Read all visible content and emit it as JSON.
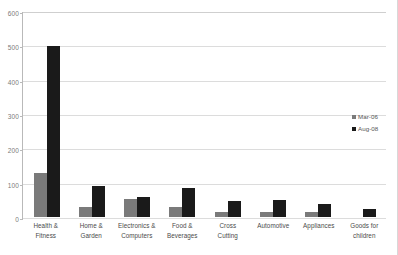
{
  "chart_data": {
    "type": "bar",
    "title": "",
    "subtitle": "",
    "xlabel": "",
    "ylabel": "",
    "ylim": [
      0,
      600
    ],
    "yticks": [
      0,
      100,
      200,
      300,
      400,
      500,
      600
    ],
    "grid": true,
    "legend_position": "right",
    "categories": [
      "Health & Fitness",
      "Home & Garden",
      "Electronics & Computers",
      "Food & Beverages",
      "Cross Cutting",
      "Automotive",
      "Appliances",
      "Goods for children"
    ],
    "category_lines": [
      [
        "Health &",
        "Fitness"
      ],
      [
        "Home &",
        "Garden"
      ],
      [
        "Electronics &",
        "Computers"
      ],
      [
        "Food &",
        "Beverages"
      ],
      [
        "Cross",
        "Cutting"
      ],
      [
        "Automotive",
        ""
      ],
      [
        "Appliances",
        ""
      ],
      [
        "Goods for",
        "children"
      ]
    ],
    "series": [
      {
        "name": "Mar-06",
        "color": "#7a7a7a",
        "values": [
          128,
          28,
          52,
          30,
          14,
          16,
          16,
          0
        ]
      },
      {
        "name": "Aug-08",
        "color": "#1a1a1a",
        "values": [
          500,
          92,
          58,
          84,
          46,
          50,
          38,
          22
        ]
      }
    ]
  },
  "legend": {
    "items": [
      {
        "label": "Mar-06",
        "color": "#7a7a7a"
      },
      {
        "label": "Aug-08",
        "color": "#1a1a1a"
      }
    ]
  }
}
